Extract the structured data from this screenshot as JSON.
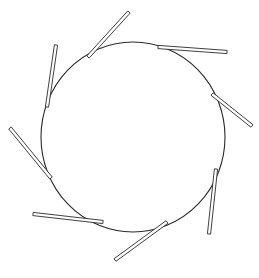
{
  "diagram": {
    "title": "",
    "colors": {
      "stroke": "#2a2a2a",
      "background": "#ffffff"
    },
    "hub": {
      "cx": 133,
      "cy": 137,
      "rx": 92,
      "ry": 95
    },
    "blade_width": 3.2,
    "blades": [
      {
        "id": "blade-1",
        "position": "top",
        "x1": 88,
        "y1": 57,
        "x2": 129,
        "y2": 12
      },
      {
        "id": "blade-2",
        "position": "top-right",
        "x1": 158,
        "y1": 47,
        "x2": 227,
        "y2": 52
      },
      {
        "id": "blade-3",
        "position": "right",
        "x1": 212,
        "y1": 94,
        "x2": 252,
        "y2": 126
      },
      {
        "id": "blade-4",
        "position": "lower-right",
        "x1": 216,
        "y1": 169,
        "x2": 209,
        "y2": 234
      },
      {
        "id": "blade-5",
        "position": "bottom",
        "x1": 167,
        "y1": 222,
        "x2": 115,
        "y2": 260
      },
      {
        "id": "blade-6",
        "position": "bottom-left",
        "x1": 103,
        "y1": 222,
        "x2": 33,
        "y2": 214
      },
      {
        "id": "blade-7",
        "position": "lower-left",
        "x1": 51,
        "y1": 178,
        "x2": 10,
        "y2": 128
      },
      {
        "id": "blade-8",
        "position": "upper-left",
        "x1": 47,
        "y1": 107,
        "x2": 56,
        "y2": 45
      }
    ]
  }
}
